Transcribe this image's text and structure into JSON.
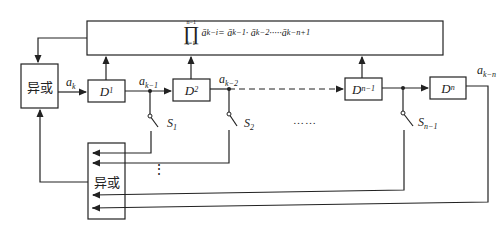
{
  "formula": {
    "lhs_symbol": "∏",
    "upper_limit": "n−1",
    "lower_limit": "i=1",
    "expression": "ā_{k−i} = ā_{k−1}·ā_{k−2}·…·ā_{k−n+1}",
    "lhs": "ā",
    "lhs_sub": "k−i",
    "rhs": "= ā",
    "rhs_sub1": "k−1",
    "mid": " · ā",
    "rhs_sub2": "k−2",
    "mid2": " ·····ā",
    "rhs_sub3": "k−n+1"
  },
  "blocks": {
    "xor_top": "异或",
    "xor_bottom": "异或",
    "d1": "D",
    "d1_sub": "1",
    "d2": "D",
    "d2_sub": "2",
    "dn1": "D",
    "dn1_sub": "n−1",
    "dn": "D",
    "dn_sub": "n"
  },
  "signals": {
    "ak": "a",
    "ak_sub": "k",
    "ak1": "a",
    "ak1_sub": "k−1",
    "ak2": "a",
    "ak2_sub": "k−2",
    "akn": "a",
    "akn_sub": "k−n"
  },
  "switches": {
    "s1": "S",
    "s1_sub": "1",
    "s2": "S",
    "s2_sub": "2",
    "sn1": "S",
    "sn1_sub": "n−1"
  },
  "ellipsis_horizontal": "……",
  "ellipsis_vertical": "⋮"
}
